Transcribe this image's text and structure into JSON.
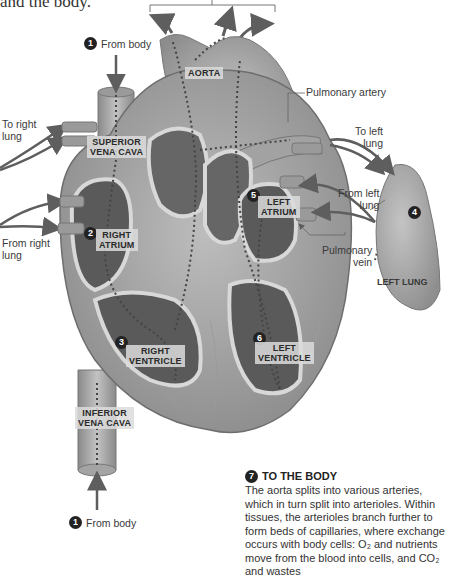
{
  "intro": {
    "text": "and the body."
  },
  "labels": {
    "from_body_top": "From body",
    "from_body_bottom": "From body",
    "to_right_lung": "To right\nlung",
    "from_right_lung": "From right\nlung",
    "pulmonary_artery": "Pulmonary artery",
    "to_left_lung": "To left\nlung",
    "from_left_lung": "From left\nlung",
    "pulmonary_vein": "Pulmonary\nvein",
    "left_lung": "LEFT LUNG"
  },
  "tags": {
    "aorta": "AORTA",
    "superior_vena_cava": "SUPERIOR\nVENA CAVA",
    "right_atrium": "RIGHT\nATRIUM",
    "left_atrium": "LEFT\nATRIUM",
    "right_ventricle": "RIGHT\nVENTRICLE",
    "left_ventricle": "LEFT\nVENTRICLE",
    "inferior_vena_cava": "INFERIOR\nVENA CAVA"
  },
  "steps": {
    "s1_top": "1",
    "s1_bottom": "1",
    "s2": "2",
    "s3": "3",
    "s4": "4",
    "s5": "5",
    "s6": "6",
    "s7": "7"
  },
  "to_the_body": {
    "title": "TO THE BODY",
    "text": "The aorta splits into various arteries, which in turn split into arterioles. Within tissues, the arterioles branch further to form beds of capillaries, where exchange occurs with body cells: O₂ and nutrients move from the blood into cells, and CO₂ and wastes"
  },
  "colors": {
    "heart_outer": "#a8a8a8",
    "heart_wall": "#c8c8c8",
    "chamber_dark": "#5a5a5a",
    "arrow": "#5e5e5e",
    "text": "#3a3a3a"
  }
}
